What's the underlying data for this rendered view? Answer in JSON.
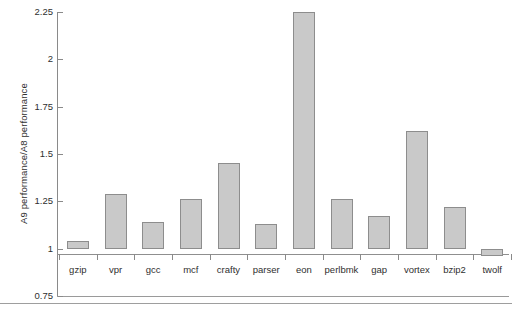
{
  "chart_data": {
    "type": "bar",
    "title": "",
    "xlabel": "",
    "ylabel": "A9 performance/A8 performance",
    "categories": [
      "gzip",
      "vpr",
      "gcc",
      "mcf",
      "crafty",
      "parser",
      "eon",
      "perlbmk",
      "gap",
      "vortex",
      "bzip2",
      "twolf"
    ],
    "values": [
      1.04,
      1.29,
      1.14,
      1.26,
      1.45,
      1.13,
      2.25,
      1.26,
      1.17,
      1.62,
      1.22,
      0.96
    ],
    "ylim": [
      0.75,
      2.25
    ],
    "ytick_labels": [
      "2.25",
      "2",
      "1.75",
      "1.5",
      "1.25",
      "1",
      "0.75"
    ],
    "ytick_values": [
      2.25,
      2,
      1.75,
      1.5,
      1.25,
      1,
      0.75
    ],
    "baseline": 1,
    "grid": false,
    "legend": null,
    "bar_fill_color": "#c9c9c9",
    "bar_border_color": "#8d8d8d",
    "axis_color": "#8a8a8a"
  }
}
